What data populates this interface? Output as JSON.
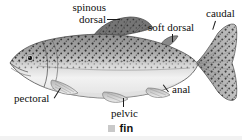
{
  "figure": {
    "style": "grayscale scientific illustration",
    "labels": [
      {
        "id": "spinous-dorsal",
        "line1": "spinous",
        "line2": "dorsal"
      },
      {
        "id": "soft-dorsal",
        "text": "soft dorsal"
      },
      {
        "id": "caudal",
        "text": "caudal"
      },
      {
        "id": "pectoral",
        "text": "pectoral"
      },
      {
        "id": "pelvic",
        "text": "pelvic"
      },
      {
        "id": "anal",
        "text": "anal"
      }
    ]
  },
  "legend": {
    "swatch_color": "#c9c9c9",
    "label": "fin"
  },
  "colors": {
    "background": "#ffffff",
    "text": "#101010",
    "fin_gray": "#c9c9c9",
    "body_dark": "#6b6b6b",
    "body_light": "#efefef"
  }
}
